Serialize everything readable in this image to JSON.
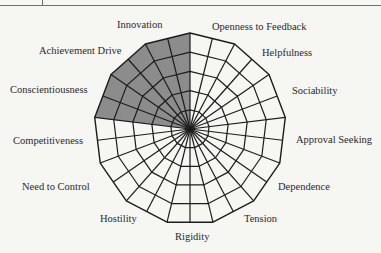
{
  "chart_data": {
    "type": "radar",
    "title": "",
    "axes": [
      "Openness to Feedback",
      "Helpfulness",
      "Sociability",
      "Approval Seeking",
      "Dependence",
      "Tension",
      "Rigidity",
      "Hostility",
      "Need to Control",
      "Competitiveness",
      "Conscientiousness",
      "Achievement Drive",
      "Innovation"
    ],
    "rings": 5,
    "scale_max": 5,
    "series": [
      {
        "name": "Profile",
        "values": [
          0,
          0,
          0,
          0,
          0,
          0,
          0,
          0,
          0,
          0,
          5,
          5,
          5
        ],
        "fill_color": "#8c8c8c"
      }
    ],
    "grid": true,
    "legend": "none",
    "grid_color": "#1c1c1c",
    "center": [
      190,
      129
    ],
    "radius": 96
  },
  "labels": [
    {
      "text": "Openness to Feedback",
      "x": 212,
      "y": 22
    },
    {
      "text": "Helpfulness",
      "x": 262,
      "y": 48
    },
    {
      "text": "Sociability",
      "x": 292,
      "y": 86
    },
    {
      "text": "Approval Seeking",
      "x": 296,
      "y": 135
    },
    {
      "text": "Dependence",
      "x": 278,
      "y": 182
    },
    {
      "text": "Tension",
      "x": 244,
      "y": 214
    },
    {
      "text": "Rigidity",
      "x": 175,
      "y": 232
    },
    {
      "text": "Hostility",
      "x": 100,
      "y": 214
    },
    {
      "text": "Need to Control",
      "x": 22,
      "y": 182
    },
    {
      "text": "Competitiveness",
      "x": 13,
      "y": 136
    },
    {
      "text": "Conscientiousness",
      "x": 10,
      "y": 85
    },
    {
      "text": "Achievement Drive",
      "x": 39,
      "y": 46
    },
    {
      "text": "Innovation",
      "x": 117,
      "y": 20
    }
  ]
}
